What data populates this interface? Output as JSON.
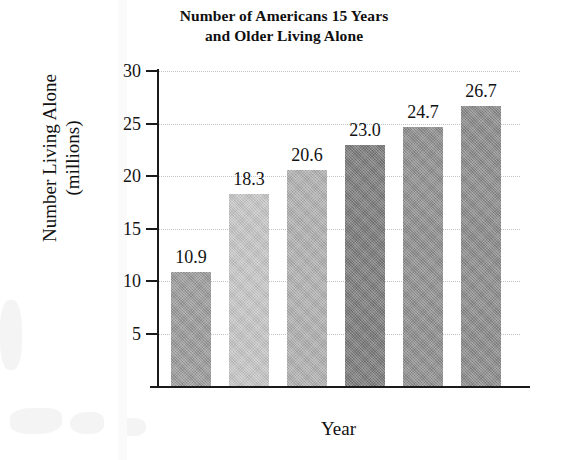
{
  "chart_data": {
    "type": "bar",
    "title": "Number of Americans 15 Years and Older Living Alone",
    "title_lines": [
      "Number of Americans 15 Years",
      "and Older Living Alone"
    ],
    "xlabel": "Year",
    "ylabel": "Number Living Alone (millions)",
    "ylabel_lines": [
      "Number Living Alone",
      "(millions)"
    ],
    "categories": [
      "1970",
      "1980",
      "1985",
      "1990",
      "1995",
      "2000"
    ],
    "values": [
      10.9,
      18.3,
      20.6,
      23.0,
      24.7,
      26.7
    ],
    "value_labels": [
      "10.9",
      "18.3",
      "20.6",
      "23.0",
      "24.7",
      "26.7"
    ],
    "bar_colors": [
      "#9a9a9a",
      "#c6c6c6",
      "#b0b0b0",
      "#7a7a7a",
      "#8e8e8e",
      "#8a8a8a"
    ],
    "ylim": [
      0,
      30
    ],
    "yticks": [
      5,
      10,
      15,
      20,
      25,
      30
    ],
    "ytick_labels": [
      "5",
      "10",
      "15",
      "20",
      "25",
      "30"
    ],
    "grid": true,
    "grid_orientation": "horizontal",
    "legend": null,
    "axis_color": "#1a1a1a",
    "grid_color": "#c4c4c4",
    "background": "#ffffff"
  }
}
